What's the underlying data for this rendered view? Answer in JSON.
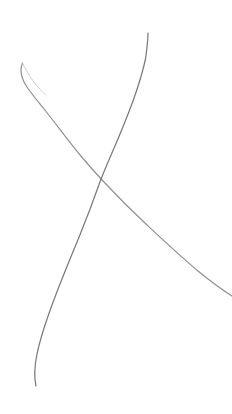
{
  "canvas": {
    "width": 232,
    "height": 414,
    "background_color": "#ffffff",
    "title": "Sketch Canvas"
  },
  "chart_data": {
    "type": "line",
    "title": "",
    "subtitle": "",
    "xlabel": "",
    "ylabel": "",
    "grid": false,
    "legend": false,
    "axes_visible": false,
    "tick_labels": [],
    "annotations": [],
    "xlim": [
      0,
      232
    ],
    "ylim": [
      0,
      414
    ],
    "note": "Two thin hand-drawn grey curves crossing near (92,175) in an X shape on a plain white field. No text, axes, ticks or legend are rendered.",
    "series": [
      {
        "name": "descending-curve",
        "stroke_color": "#8a8a8a",
        "stroke_width": 1.2,
        "opacity": 0.95,
        "direction": "top-left to right edge, descending",
        "has_start_loop": true,
        "path": "M 22.5 63 C 19.5 70.5, 21.5 79, 27 87 C 32 94.5, 38.5 102, 46 111.5 C 56 124, 68.5 141, 80.5 155.5 C 88 164.5, 95.5 173, 103 181 C 117 196, 132 211, 147 225 C 163 240, 180 256, 198 271 C 209 280, 220 288.5, 232 296",
        "points": [
          [
            22.5,
            63
          ],
          [
            27,
            87
          ],
          [
            33,
            95
          ],
          [
            46,
            111.5
          ],
          [
            62,
            132
          ],
          [
            80.5,
            155.5
          ],
          [
            92,
            175
          ],
          [
            110,
            189
          ],
          [
            130,
            209
          ],
          [
            150,
            228
          ],
          [
            172,
            248
          ],
          [
            196,
            269
          ],
          [
            215,
            281
          ],
          [
            232,
            289
          ]
        ]
      },
      {
        "name": "descending-curve-loop-return",
        "stroke_color": "#c0c0c0",
        "stroke_width": 0.9,
        "opacity": 0.85,
        "direction": "small hook doubling back at the top-left terminus",
        "path": "M 22.5 63 C 25.5 69, 29 75.5, 33.5 81.5 C 37 86, 41 90.5, 45.5 95",
        "points": [
          [
            22.5,
            63
          ],
          [
            28,
            73
          ],
          [
            33.5,
            81.5
          ],
          [
            45.5,
            95
          ]
        ]
      },
      {
        "name": "rising-line",
        "stroke_color": "#6f6f6f",
        "stroke_width": 1.2,
        "opacity": 0.95,
        "direction": "bottom-left tail rising to top-right terminus",
        "path": "M 36 386 C 34 377, 34.5 366, 37 354 C 40.5 337.5, 47 318, 55 297 C 62.5 277, 71 256.5, 79.5 236 C 86 220, 92.5 203, 98.5 186 C 102 176, 106.5 165.5, 111.5 154 C 118.5 138, 126 120, 133 101 C 138 87, 142.5 73, 145.5 59 C 146.8 50, 147.8 41, 148 33",
        "points": [
          [
            36,
            386
          ],
          [
            36.5,
            368
          ],
          [
            42,
            330
          ],
          [
            55,
            297
          ],
          [
            70,
            260
          ],
          [
            85,
            220
          ],
          [
            92,
            175
          ],
          [
            98.5,
            186
          ],
          [
            111.5,
            154
          ],
          [
            124,
            125
          ],
          [
            133,
            101
          ],
          [
            141,
            76
          ],
          [
            146,
            52
          ],
          [
            148,
            33
          ]
        ]
      }
    ],
    "intersections": [
      [
        92,
        175
      ]
    ],
    "stroke_colors": [
      "#8a8a8a",
      "#c0c0c0",
      "#6f6f6f"
    ]
  }
}
